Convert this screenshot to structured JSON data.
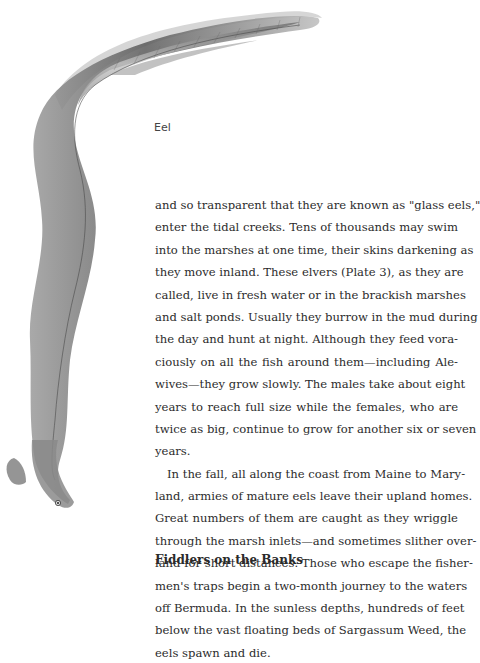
{
  "figure": {
    "caption": "Eel",
    "illustration": "eel-illustration"
  },
  "paragraphs": [
    {
      "lines": [
        "and so transparent that they are known as \"glass eels,\"",
        "enter the tidal creeks. Tens of thousands may swim",
        "into the marshes at one time, their skins darkening as",
        "they move inland. These elvers (Plate 3), as they are",
        "called, live in fresh water or in the brackish marshes",
        "and salt ponds. Usually they burrow in the mud during",
        "the day and hunt at night. Although they feed vora-",
        "ciously on all the fish around them—including Ale-",
        "wives—they grow slowly. The males take about eight",
        "years to reach full size while the females, who are",
        "twice as big, continue to grow for another six or seven",
        "years."
      ]
    },
    {
      "lines": [
        "In the fall, all along the coast from Maine to Mary-",
        "land, armies of mature eels leave their upland homes.",
        "Great numbers of them are caught as they wriggle",
        "through the marsh inlets—and sometimes slither over-",
        "land for short distances. Those who escape the fisher-",
        "men's traps begin a two-month journey to the waters",
        "off Bermuda. In the sunless depths, hundreds of feet",
        "below the vast floating beds of Sargassum Weed, the",
        "eels spawn and die."
      ]
    }
  ],
  "section_heading": "Fiddlers on the Banks"
}
